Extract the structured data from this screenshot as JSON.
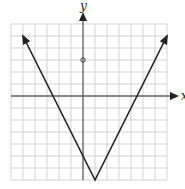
{
  "chart_data": {
    "type": "line",
    "title": "",
    "xlabel": "x",
    "ylabel": "y",
    "xlim": [
      -6,
      7
    ],
    "ylim": [
      -7,
      6
    ],
    "grid": true,
    "function": "y = 2|x - 1| - 7",
    "series": [
      {
        "name": "absolute-value-graph",
        "x": [
          -5,
          1,
          7
        ],
        "y": [
          5,
          -7,
          5
        ],
        "arrows": true
      }
    ],
    "points": [
      {
        "x": 0,
        "y": 3
      }
    ],
    "colors": {
      "line": "#222222",
      "grid": "#c8c8c8",
      "axis": "#666666"
    }
  }
}
